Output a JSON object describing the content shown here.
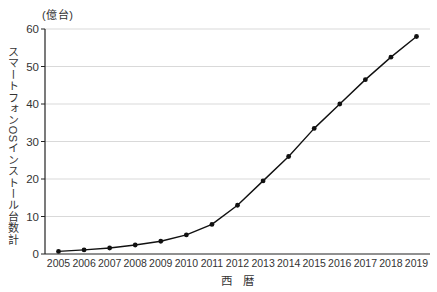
{
  "chart": {
    "unit_label": "(億台)",
    "y_axis_title": "スマートフォンOSインストール台数計",
    "x_axis_title": "西　暦"
  },
  "chart_data": {
    "type": "line",
    "title": "",
    "xlabel": "西暦",
    "ylabel": "スマートフォンOSインストール台数計",
    "unit": "億台",
    "categories": [
      "2005",
      "2006",
      "2007",
      "2008",
      "2009",
      "2010",
      "2011",
      "2012",
      "2013",
      "2014",
      "2015",
      "2016",
      "2017",
      "2018",
      "2019"
    ],
    "values": [
      0.7,
      1.1,
      1.6,
      2.4,
      3.4,
      5.1,
      7.9,
      13.0,
      19.5,
      26.0,
      33.5,
      40.0,
      46.5,
      52.5,
      58.0
    ],
    "yticks": [
      0,
      10,
      20,
      30,
      40,
      50,
      60
    ],
    "ylim": [
      0,
      60
    ],
    "grid": true,
    "legend": "none",
    "line_color": "#111111",
    "marker": "circle",
    "marker_color": "#111111",
    "grid_color": "#d9d9d9",
    "axis_color": "#222222"
  }
}
